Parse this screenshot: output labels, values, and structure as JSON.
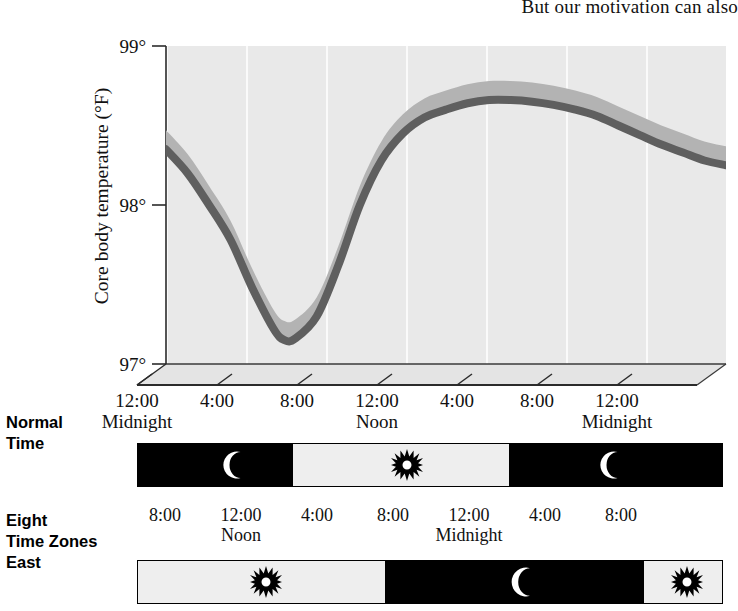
{
  "page": {
    "top_text": "But our motivation can also"
  },
  "chart_data": {
    "type": "line",
    "title": "",
    "xlabel": "",
    "ylabel": "Core body temperature (°F)",
    "ylim": [
      97,
      99
    ],
    "ytick_labels": [
      "99°",
      "98°",
      "97°"
    ],
    "ytick_values": [
      99,
      98,
      97
    ],
    "xlim_hours": [
      0,
      26
    ],
    "xtick_hours": [
      0,
      4,
      8,
      12,
      16,
      20,
      24
    ],
    "xtick_labels": [
      "12:00",
      "4:00",
      "8:00",
      "12:00",
      "4:00",
      "8:00",
      "12:00"
    ],
    "xtick_sublabels": [
      "Midnight",
      "",
      "",
      "Noon",
      "",
      "",
      "Midnight"
    ],
    "grid": "vertical-only",
    "legend": "none",
    "series": [
      {
        "name": "Core body temperature",
        "x": [
          0,
          1,
          2,
          3,
          4,
          5,
          5.5,
          6,
          7,
          8,
          9,
          10,
          11,
          12,
          13,
          14,
          15,
          16,
          17,
          18,
          19,
          20,
          21,
          22,
          23,
          24,
          25,
          26
        ],
        "values": [
          98.35,
          98.2,
          98.0,
          97.78,
          97.48,
          97.22,
          97.15,
          97.16,
          97.3,
          97.62,
          98.0,
          98.28,
          98.45,
          98.55,
          98.6,
          98.64,
          98.66,
          98.66,
          98.65,
          98.63,
          98.6,
          98.56,
          98.5,
          98.44,
          98.38,
          98.33,
          98.28,
          98.25
        ]
      }
    ],
    "band": {
      "name": "variability band",
      "upper_offset": 0.12,
      "lower_offset": 0.0,
      "color": "#b3b3b3"
    },
    "line_color": "#5f5f5f",
    "panel_color": "#e9e9e9",
    "gridline_color": "#fafafa"
  },
  "timeline_rows": [
    {
      "label": "Normal\nTime",
      "label_lines": [
        "Normal",
        "Time"
      ],
      "tick_labels": [
        "12:00",
        "4:00",
        "8:00",
        "12:00",
        "4:00",
        "8:00",
        "12:00"
      ],
      "tick_sublabels": [
        "Midnight",
        "",
        "",
        "Noon",
        "",
        "",
        "Midnight"
      ],
      "segments": [
        {
          "kind": "night",
          "icon": "moon-icon",
          "start_pct": 0,
          "end_pct": 26.5
        },
        {
          "kind": "day",
          "icon": "sun-icon",
          "start_pct": 26.5,
          "end_pct": 63.5
        },
        {
          "kind": "night",
          "icon": "moon-icon",
          "start_pct": 63.5,
          "end_pct": 100
        }
      ]
    },
    {
      "label": "Eight\nTime Zones\nEast",
      "label_lines": [
        "Eight",
        "Time Zones",
        "East"
      ],
      "tick_labels": [
        "8:00",
        "12:00",
        "4:00",
        "8:00",
        "12:00",
        "4:00",
        "8:00"
      ],
      "tick_sublabels": [
        "",
        "Noon",
        "",
        "",
        "Midnight",
        "",
        ""
      ],
      "segments": [
        {
          "kind": "day",
          "icon": "sun-icon",
          "start_pct": 0,
          "end_pct": 42.3
        },
        {
          "kind": "night",
          "icon": "moon-icon",
          "start_pct": 42.3,
          "end_pct": 86.6
        },
        {
          "kind": "day",
          "icon": "sun-icon",
          "start_pct": 86.6,
          "end_pct": 100
        }
      ]
    }
  ],
  "colors": {
    "panel": "#e9e9e9",
    "line": "#5f5f5f",
    "band": "#b3b3b3",
    "night": "#000000",
    "day": "#eeeeee",
    "text": "#111111"
  }
}
